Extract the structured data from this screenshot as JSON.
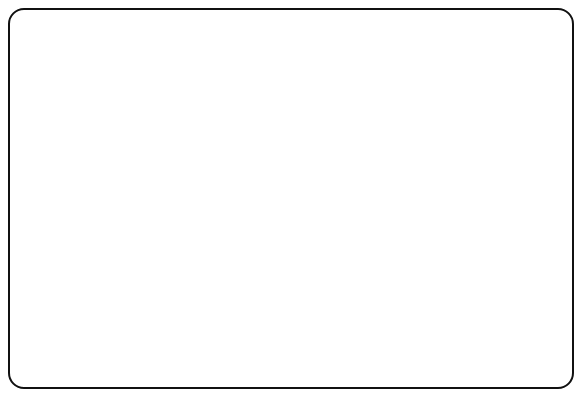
{
  "chart_data": {
    "type": "line",
    "title": "",
    "xlabel": "Decades from Present",
    "ylabel": "Timber Harvesting Land Base (Hectares)",
    "xlim": [
      0,
      20
    ],
    "ylim": [
      0,
      300000
    ],
    "grid": false,
    "legend_position": "inline-labels",
    "x": [
      0,
      1,
      2,
      3,
      4,
      5,
      6,
      7,
      8,
      9,
      10,
      11,
      12,
      13,
      14,
      15,
      16,
      17,
      18,
      19,
      20
    ],
    "x_tick_labels": [
      "0",
      "1",
      "2",
      "3",
      "4",
      "5",
      "6",
      "7",
      "8",
      "9",
      "10",
      "11",
      "12",
      "13",
      "14",
      "15",
      "16",
      "17",
      "18",
      "19",
      "20"
    ],
    "y_tick_labels": [
      "0",
      "50,000",
      "100,000",
      "150,000",
      "200,000",
      "250,000",
      "300,000"
    ],
    "y_ticks": [
      0,
      50000,
      100000,
      150000,
      200000,
      250000,
      300000
    ],
    "annotation": {
      "line1": "Over 250 years (includes area in streamside",
      "line2": "buffers and representative forest types)",
      "value": 262000
    },
    "series": [
      {
        "name": "Over 250 years",
        "label": "Over 250 years (includes area in streamside buffers and representative forest types)",
        "values": [
          262000,
          262000,
          262000,
          262000,
          262000,
          262000,
          262000,
          262000,
          262000,
          262000,
          262000,
          262000,
          262000,
          262000,
          262000,
          262000,
          262000,
          262000,
          262000,
          262000,
          262000
        ]
      },
      {
        "name": "141-250 years",
        "label": "141-250\nyears",
        "values": [
          108000,
          126000,
          142000,
          155000,
          152000,
          151000,
          166000,
          182000,
          196000,
          210000,
          222000,
          228000,
          230000,
          230000,
          231000,
          231000,
          232000,
          232000,
          232000,
          232000,
          233000
        ]
      },
      {
        "name": "121-140 years",
        "label": "121-140 years",
        "values": [
          38000,
          49000,
          62000,
          79000,
          97000,
          117000,
          137000,
          158000,
          179000,
          199000,
          216000,
          226000,
          230000,
          228000,
          225000,
          223000,
          221000,
          223000,
          222000,
          221000,
          222000
        ]
      },
      {
        "name": "101-120 years",
        "label": "101-120 years",
        "values": [
          31000,
          42000,
          55000,
          72000,
          91000,
          111000,
          132000,
          153000,
          174000,
          194000,
          207000,
          202000,
          192000,
          182000,
          180000,
          181000,
          183000,
          185000,
          187000,
          188000,
          189000
        ]
      },
      {
        "name": "81-100 years",
        "label": "81-100 years",
        "values": [
          27000,
          38000,
          51000,
          68000,
          87000,
          107000,
          128000,
          150000,
          172000,
          178000,
          165000,
          150000,
          139000,
          133000,
          134000,
          137000,
          139000,
          142000,
          148000,
          155000,
          162000
        ]
      },
      {
        "name": "61-81 years",
        "label": "61-81 years",
        "values": [
          23000,
          34000,
          47000,
          64000,
          83000,
          104000,
          126000,
          146000,
          143000,
          131000,
          118000,
          106000,
          101000,
          99000,
          103000,
          107000,
          110000,
          113000,
          125000,
          128000,
          128000
        ]
      },
      {
        "name": "41-60 years",
        "label": "41-60 years",
        "values": [
          21000,
          31000,
          44000,
          61000,
          80000,
          101000,
          122000,
          114000,
          103000,
          95000,
          90000,
          85000,
          84000,
          85000,
          89000,
          94000,
          99000,
          101000,
          103000,
          103000,
          103000
        ]
      },
      {
        "name": "21-40 years",
        "label": "21-40 years",
        "values": [
          18000,
          28000,
          41000,
          58000,
          77000,
          109000,
          98000,
          88000,
          81000,
          75000,
          70000,
          64000,
          59000,
          55000,
          58000,
          63000,
          67000,
          68000,
          68000,
          68000,
          68000
        ]
      },
      {
        "name": "0-20 years",
        "label": "0-20 years",
        "values": [
          18000,
          31000,
          45000,
          65000,
          63000,
          58000,
          52000,
          47000,
          43000,
          39000,
          36000,
          32000,
          28000,
          26000,
          28000,
          33000,
          38000,
          38000,
          38000,
          38000,
          38000
        ]
      }
    ],
    "inline_labels": [
      {
        "text": "121-140 years",
        "x": 416,
        "y": 116
      },
      {
        "text": "101-120 years",
        "x": 352,
        "y": 142
      },
      {
        "text": "81-100 years",
        "x": 316,
        "y": 172
      },
      {
        "text": "61-81 years",
        "x": 264,
        "y": 206
      },
      {
        "text": "41-60 years",
        "x": 232,
        "y": 240
      },
      {
        "text": "21-40 years",
        "x": 208,
        "y": 272
      },
      {
        "text": "0-20 years",
        "x": 133,
        "y": 307
      },
      {
        "text": "141-250",
        "x": 122,
        "y": 224
      },
      {
        "text": "years",
        "x": 122,
        "y": 236
      }
    ]
  }
}
